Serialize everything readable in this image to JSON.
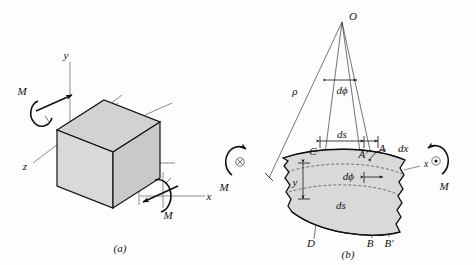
{
  "figure": {
    "captions": {
      "a": "(a)",
      "b": "(b)"
    }
  },
  "panel_a": {
    "name": "Undeformed rectangular beam element with applied bending moments",
    "axes": {
      "y": "y",
      "z": "z",
      "x": "x"
    },
    "moments": {
      "left_label": "M",
      "right_label": "M"
    },
    "icons": {
      "left_moment": "curved-arrow-icon",
      "right_moment": "curved-arrow-icon",
      "left_vector": "arrow-head-icon",
      "right_vector": "arrow-head-icon"
    },
    "colors": {
      "face_front": "#d9d9d9",
      "face_top": "#d2d2d2",
      "face_side": "#c9c9c9",
      "outline": "#111111",
      "axis": "#6e6e6e"
    }
  },
  "panel_b": {
    "name": "Deformed beam element showing curvature, radius and angular change",
    "points": {
      "apex": "O",
      "c": "C",
      "a_prime": "A'",
      "a": "A",
      "d": "D",
      "b": "B",
      "b_prime": "B'"
    },
    "labels": {
      "rho": "ρ",
      "d_phi_top": "dϕ",
      "ds_top": "ds",
      "dx": "dx",
      "d_phi_mid": "dϕ",
      "y": "y",
      "ds_bottom": "ds",
      "x_axis": "x"
    },
    "moments": {
      "left_label": "M",
      "right_label": "M",
      "left_symbol": "⊗",
      "right_symbol": "⊙"
    },
    "icons": {
      "left_moment": "curved-arrow-icon",
      "right_moment": "curved-arrow-icon",
      "left_moment_symbol": "cross-in-circle-icon",
      "right_moment_symbol": "dot-in-circle-icon"
    },
    "colors": {
      "wedge_fill": "#d9d9d9",
      "outline": "#111111",
      "neutral_axis": "#444444"
    }
  }
}
